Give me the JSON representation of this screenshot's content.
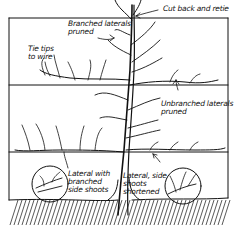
{
  "diagram": {
    "type": "pruning-illustration",
    "colors": {
      "ink": "#111111",
      "background": "#ffffff"
    },
    "labels": {
      "cut_back": "Cut back and retie",
      "branched_laterals": "Branched laterals\npruned",
      "tie_tips": "Tie tips\nto wire",
      "unbranched_laterals": "Unbranched laterals\npruned",
      "lateral_branched": "Lateral with\nbranched\nside shoots",
      "lateral_shortened": "Lateral, side\nshoots\nshortened"
    },
    "wires": [
      {
        "y": 18
      },
      {
        "y": 85
      },
      {
        "y": 152
      }
    ],
    "insets": [
      {
        "name": "lateral-with-branched-side-shoots",
        "cx": 50,
        "cy": 184,
        "r": 18
      },
      {
        "name": "lateral-side-shoots-shortened",
        "cx": 183,
        "cy": 186,
        "r": 18
      }
    ]
  }
}
